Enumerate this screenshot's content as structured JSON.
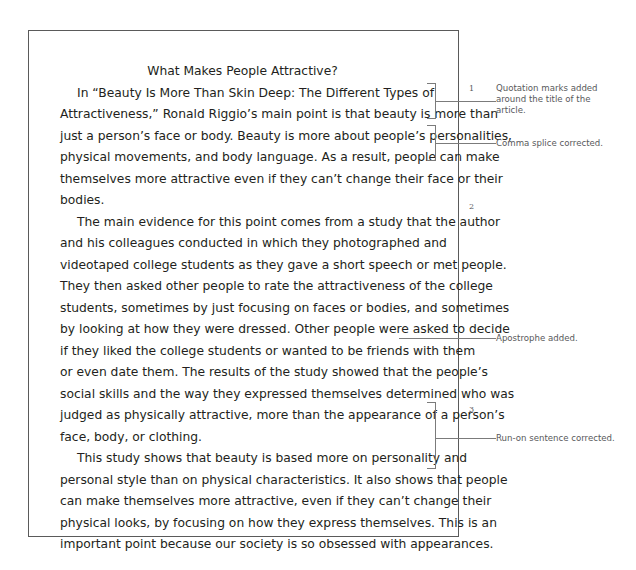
{
  "document": {
    "title": "What Makes People Attractive?",
    "paragraphs": [
      {
        "id": "paragraph-1",
        "lines": [
          "In “Beauty Is More Than Skin Deep: The Different Types of",
          "Attractiveness,” Ronald Riggio’s main point is that beauty is more than",
          "just a person’s face or body. Beauty is more about people’s personalities,",
          "physical movements, and body language. As a result, people can make",
          "themselves more attractive even if they can’t change their face or their",
          "bodies."
        ]
      },
      {
        "id": "paragraph-2",
        "lines": [
          "The main evidence for this point comes from a study that the author",
          "and his colleagues conducted in which they photographed and",
          "videotaped college students as they gave a short speech or met people.",
          "They then asked other people to rate the attractiveness of the college",
          "students, sometimes by just focusing on faces or bodies, and sometimes",
          "by looking at how they were dressed. Other people were asked to decide",
          "if they liked the college students or wanted to be friends with them",
          "or even date them. The results of the study showed that the people’s",
          "social skills and the way they expressed themselves determined who was",
          "judged as physically attractive, more than the appearance of a person’s",
          "face, body, or clothing."
        ]
      },
      {
        "id": "paragraph-3",
        "lines": [
          "This study shows that beauty is based more on personality and",
          "personal style than on physical characteristics. It also shows that people",
          "can make themselves more attractive, even if they can’t change their",
          "physical looks, by focusing on how they express themselves. This is an",
          "important point because our society is so obsessed with appearances."
        ]
      }
    ]
  },
  "annotations": [
    {
      "number": "1",
      "text": "Quotation marks added around the title of the article."
    },
    {
      "number": "",
      "text": "Comma splice corrected."
    },
    {
      "number": "2",
      "text": ""
    },
    {
      "number": "",
      "text": "Apostrophe added."
    },
    {
      "number": "3",
      "text": "Run-on sentence corrected."
    }
  ],
  "paragraph_numbers": {
    "first": "1",
    "second": "2",
    "third": "3"
  },
  "annotation_labels": {
    "quotation_marks": "Quotation marks added around the title of the article.",
    "comma_splice": "Comma splice corrected.",
    "apostrophe": "Apostrophe added.",
    "run_on": "Run-on sentence corrected."
  },
  "colors": {
    "page_border": "#5a5a5a",
    "body_text": "#231f20",
    "annotation_text": "#58595b",
    "leader_line": "#7b7b7b",
    "background": "#ffffff"
  }
}
